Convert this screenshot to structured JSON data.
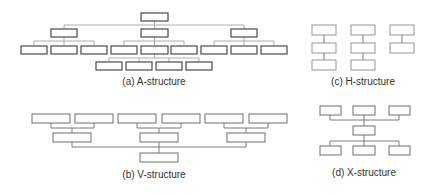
{
  "figure": {
    "panels": [
      {
        "id": "a",
        "caption": "(a) A-structure"
      },
      {
        "id": "b",
        "caption": "(b) V-structure"
      },
      {
        "id": "c",
        "caption": "(c) H-structure"
      },
      {
        "id": "d",
        "caption": "(d) X-structure"
      }
    ]
  },
  "colors": {
    "background": "#ffffff",
    "box_stroke_dark": "#4a4a4a",
    "box_stroke_light": "#8a8a8a",
    "connector": "#9a9a9a"
  }
}
